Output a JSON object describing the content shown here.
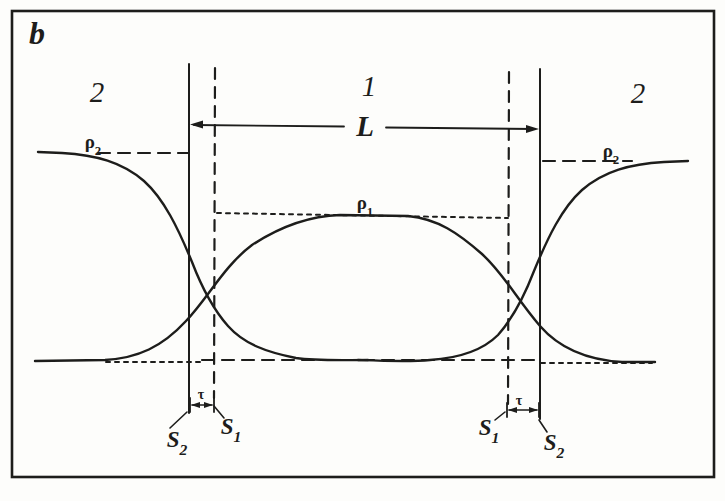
{
  "figure": {
    "panel_label": "b",
    "region_left": "2",
    "region_center": "1",
    "region_right": "2",
    "length_label": "L",
    "tau_label": "τ"
  },
  "profiles": {
    "rho1": {
      "base": "ρ",
      "sub": "1"
    },
    "rho2_left": {
      "base": "ρ",
      "sub": "2"
    },
    "rho2_right": {
      "base": "ρ",
      "sub": "2"
    }
  },
  "surfaces": {
    "s2_left": {
      "base": "S",
      "sub": "2"
    },
    "s1_left": {
      "base": "S",
      "sub": "1"
    },
    "s1_right": {
      "base": "S",
      "sub": "1"
    },
    "s2_right": {
      "base": "S",
      "sub": "2"
    }
  },
  "colors": {
    "ink": "#1d1d1b",
    "paper": "#fdfdfb"
  }
}
